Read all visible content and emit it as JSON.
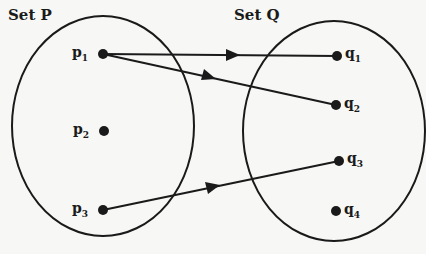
{
  "sets": [
    {
      "id": "P",
      "label": "Set P",
      "elements": [
        {
          "id": "p1",
          "base": "p",
          "sub": "1",
          "x": 103,
          "y": 54
        },
        {
          "id": "p2",
          "base": "p",
          "sub": "2",
          "x": 104,
          "y": 131
        },
        {
          "id": "p3",
          "base": "p",
          "sub": "3",
          "x": 103,
          "y": 210
        }
      ]
    },
    {
      "id": "Q",
      "label": "Set Q",
      "elements": [
        {
          "id": "q1",
          "base": "q",
          "sub": "1",
          "x": 337,
          "y": 56
        },
        {
          "id": "q2",
          "base": "q",
          "sub": "2",
          "x": 336,
          "y": 105
        },
        {
          "id": "q3",
          "base": "q",
          "sub": "3",
          "x": 339,
          "y": 161
        },
        {
          "id": "q4",
          "base": "q",
          "sub": "4",
          "x": 336,
          "y": 211
        }
      ]
    }
  ],
  "mappings": [
    {
      "from": "p1",
      "to": "q1"
    },
    {
      "from": "p1",
      "to": "q2"
    },
    {
      "from": "p3",
      "to": "q3"
    }
  ],
  "colors": {
    "ink": "#1a1a1a",
    "background": "#f7f7f5"
  }
}
